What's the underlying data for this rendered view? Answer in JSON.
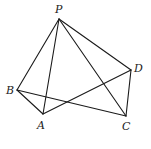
{
  "diagram": {
    "type": "pyramid",
    "vertices": [
      {
        "name": "P",
        "x": 59,
        "y": 19,
        "lx": 55,
        "ly": 13
      },
      {
        "name": "B",
        "x": 17,
        "y": 90,
        "lx": 6,
        "ly": 94
      },
      {
        "name": "A",
        "x": 43,
        "y": 114,
        "lx": 37,
        "ly": 129
      },
      {
        "name": "C",
        "x": 126,
        "y": 116,
        "lx": 122,
        "ly": 130
      },
      {
        "name": "D",
        "x": 131,
        "y": 70,
        "lx": 134,
        "ly": 72
      }
    ],
    "edges": [
      [
        "P",
        "B"
      ],
      [
        "P",
        "A"
      ],
      [
        "P",
        "C"
      ],
      [
        "P",
        "D"
      ],
      [
        "B",
        "A"
      ],
      [
        "B",
        "C"
      ],
      [
        "A",
        "D"
      ],
      [
        "D",
        "C"
      ]
    ],
    "labels": {
      "P": "P",
      "B": "B",
      "A": "A",
      "C": "C",
      "D": "D"
    }
  }
}
